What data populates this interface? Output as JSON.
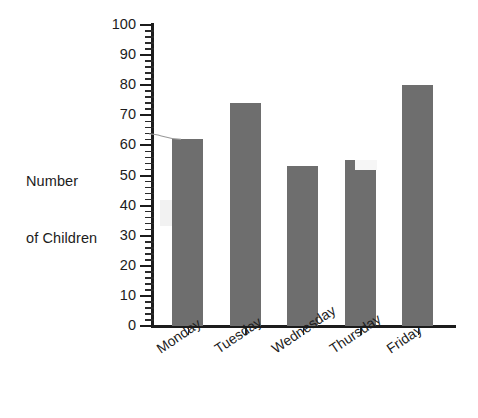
{
  "chart_data": {
    "type": "bar",
    "title": "",
    "subtitle": "",
    "xlabel": "",
    "ylabel": "Number\nof Children",
    "ylabel_line1": "Number",
    "ylabel_line2": "of Children",
    "categories": [
      "Monday",
      "Tuesday",
      "Wednesday",
      "Thursday",
      "Friday"
    ],
    "values": [
      62,
      74,
      53,
      55,
      80
    ],
    "ylim": [
      0,
      100
    ],
    "ytick_labels": [
      "0",
      "10",
      "20",
      "30",
      "40",
      "50",
      "60",
      "70",
      "80",
      "90",
      "100"
    ],
    "ytick_values": [
      0,
      10,
      20,
      30,
      40,
      50,
      60,
      70,
      80,
      90,
      100
    ],
    "y_minor_tick_interval": 2,
    "grid": false,
    "legend": null,
    "legend_position": "none",
    "bar_color": "#6e6e6e",
    "axis_color": "#1c1c1c",
    "background_color": "#ffffff",
    "xlabel_rotation_degrees": -34,
    "annotations": []
  }
}
